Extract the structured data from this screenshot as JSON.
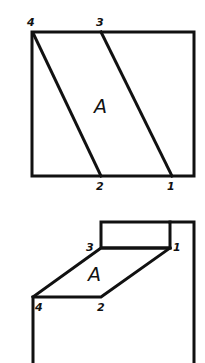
{
  "figure": {
    "type": "orthographic projection of inclined plane",
    "plane_label": "A",
    "stroke_color": "#111111",
    "background": "#ffffff"
  },
  "top_view": {
    "frame": {
      "x1": 32,
      "y1": 32,
      "x2": 194,
      "y2": 176
    },
    "plane_label": "A",
    "points": [
      {
        "id": "4",
        "label": "4",
        "x": 32,
        "y": 32
      },
      {
        "id": "3",
        "label": "3",
        "x": 101,
        "y": 32
      },
      {
        "id": "2",
        "label": "2",
        "x": 101,
        "y": 176
      },
      {
        "id": "1",
        "label": "1",
        "x": 172,
        "y": 176
      }
    ],
    "edges": [
      [
        "4",
        "2"
      ],
      [
        "3",
        "1"
      ]
    ]
  },
  "front_view": {
    "plane_label": "A",
    "block": {
      "x1": 100,
      "y1": 222,
      "x2": 170,
      "y2": 248
    },
    "outline_right_x": 194,
    "points": [
      {
        "id": "3",
        "label": "3",
        "x": 101,
        "y": 248
      },
      {
        "id": "1",
        "label": "1",
        "x": 170,
        "y": 248
      },
      {
        "id": "2",
        "label": "2",
        "x": 101,
        "y": 297
      },
      {
        "id": "4",
        "label": "4",
        "x": 32,
        "y": 297
      }
    ]
  }
}
